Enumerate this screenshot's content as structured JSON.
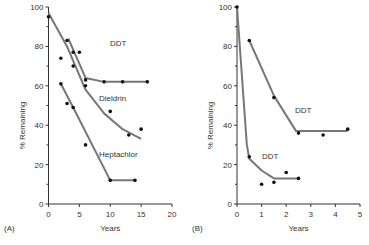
{
  "chart_data": [
    {
      "type": "line",
      "panel": "(A)",
      "xlabel": "Years",
      "ylabel": "% Remaining",
      "xlim": [
        0,
        20
      ],
      "ylim": [
        0,
        100
      ],
      "xticks": [
        0,
        5,
        10,
        15,
        20
      ],
      "yticks": [
        0,
        20,
        40,
        60,
        80,
        100
      ],
      "series": [
        {
          "name": "DDT",
          "points": [
            [
              3,
              83
            ],
            [
              4,
              77
            ],
            [
              5,
              77
            ],
            [
              6,
              63
            ],
            [
              9,
              62
            ],
            [
              12,
              62
            ],
            [
              16,
              62
            ]
          ],
          "curve": [
            [
              3.2,
              84
            ],
            [
              6,
              64
            ],
            [
              9,
              62
            ],
            [
              16,
              62
            ]
          ]
        },
        {
          "name": "Dieldrin",
          "points": [
            [
              0,
              95
            ],
            [
              2,
              74
            ],
            [
              4,
              70
            ],
            [
              6,
              60
            ],
            [
              10,
              47
            ],
            [
              13,
              35
            ],
            [
              15,
              38
            ]
          ],
          "curve": [
            [
              0,
              97
            ],
            [
              3,
              80
            ],
            [
              6,
              58
            ],
            [
              9,
              46
            ],
            [
              12,
              38
            ],
            [
              15,
              33
            ]
          ]
        },
        {
          "name": "Heptachlor",
          "points": [
            [
              2,
              61
            ],
            [
              3,
              51
            ],
            [
              4,
              49
            ],
            [
              6,
              30
            ],
            [
              10,
              12
            ],
            [
              14,
              12
            ]
          ],
          "curve": [
            [
              2,
              61
            ],
            [
              4,
              49
            ],
            [
              10,
              12
            ],
            [
              14,
              12
            ]
          ]
        }
      ]
    },
    {
      "type": "line",
      "panel": "(B)",
      "xlabel": "Years",
      "ylabel": "% Remaining",
      "xlim": [
        0,
        5
      ],
      "ylim": [
        0,
        100
      ],
      "xticks": [
        0,
        1,
        2,
        3,
        4,
        5
      ],
      "yticks": [
        0,
        20,
        40,
        60,
        80,
        100
      ],
      "series": [
        {
          "name": "DDT",
          "points": [
            [
              0.5,
              83
            ],
            [
              1.5,
              54
            ],
            [
              2.5,
              36
            ],
            [
              3.5,
              35
            ],
            [
              4.5,
              38
            ]
          ],
          "curve": [
            [
              0.5,
              83
            ],
            [
              1.5,
              55
            ],
            [
              2.4,
              37
            ],
            [
              4.5,
              37
            ]
          ]
        },
        {
          "name": "DDT",
          "points": [
            [
              0,
              100
            ],
            [
              0.5,
              24
            ],
            [
              1,
              10
            ],
            [
              1.5,
              11
            ],
            [
              2,
              16
            ],
            [
              2.5,
              13
            ]
          ],
          "curve": [
            [
              0,
              100
            ],
            [
              0.4,
              30
            ],
            [
              0.5,
              23
            ],
            [
              1,
              17
            ],
            [
              1.5,
              13
            ],
            [
              2.5,
              13
            ]
          ]
        }
      ]
    }
  ],
  "labels": {
    "a_ddt": "DDT",
    "a_dieldrin": "Dieldrin",
    "a_heptachlor": "Heptachlor",
    "b_ddt_upper": "DDT",
    "b_ddt_lower": "DDT",
    "panel_a": "(A)",
    "panel_b": "(B)",
    "xlabel": "Years",
    "ylabel": "% Remaining"
  }
}
